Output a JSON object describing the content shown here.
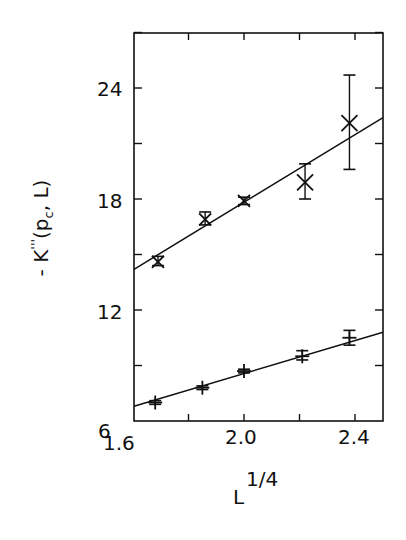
{
  "chart_data": {
    "type": "scatter",
    "title": "",
    "xlabel": "L^{1/4}",
    "xlabel_base": "L",
    "xlabel_sup": "1/4",
    "ylabel": "-K'''(p_c, L)",
    "ylabel_parts": {
      "prefix": "- K",
      "primes": "'''",
      "open": "(p",
      "sub": "c",
      "close": ", L)"
    },
    "xlim": [
      1.6,
      2.5
    ],
    "ylim": [
      6,
      28
    ],
    "xticks": [
      1.6,
      1.8,
      2.0,
      2.2,
      2.4
    ],
    "xtick_labels": [
      "1.6",
      "2.0",
      "2.4"
    ],
    "yticks": [
      6,
      9,
      12,
      15,
      18,
      21,
      24,
      27
    ],
    "ytick_labels": [
      "6",
      "12",
      "18",
      "24"
    ],
    "grid": false,
    "legend": null,
    "series": [
      {
        "name": "upper",
        "marker": "x",
        "x": [
          1.69,
          1.86,
          2.0,
          2.22,
          2.38
        ],
        "y": [
          14.6,
          16.9,
          17.9,
          18.9,
          22.1
        ],
        "yerr_low": [
          14.4,
          16.6,
          17.7,
          18.0,
          19.6
        ],
        "yerr_high": [
          14.9,
          17.3,
          18.1,
          19.9,
          24.7
        ],
        "fit_line": {
          "x": [
            1.6,
            2.5
          ],
          "y": [
            14.2,
            22.4
          ]
        }
      },
      {
        "name": "lower",
        "marker": "+",
        "x": [
          1.68,
          1.85,
          2.0,
          2.21,
          2.38
        ],
        "y": [
          7.0,
          7.8,
          8.7,
          9.5,
          10.5
        ],
        "yerr_low": [
          6.9,
          7.7,
          8.6,
          9.3,
          10.1
        ],
        "yerr_high": [
          7.1,
          7.9,
          8.8,
          9.8,
          10.9
        ],
        "fit_line": {
          "x": [
            1.6,
            2.5
          ],
          "y": [
            6.8,
            10.8
          ]
        }
      }
    ]
  }
}
